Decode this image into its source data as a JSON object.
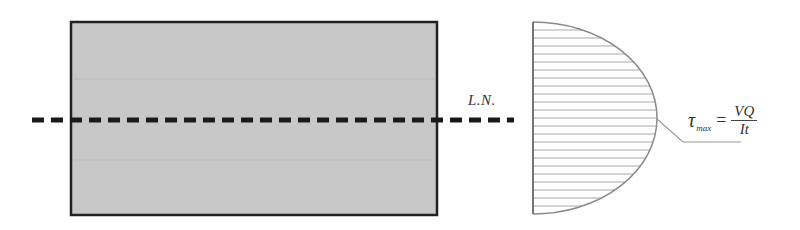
{
  "diagram": {
    "cross_section": {
      "shape": "rectangle",
      "fill_color": "#c8c8c8",
      "border_color": "#222222"
    },
    "neutral_axis": {
      "label": "L.N.",
      "style": "dashed",
      "color": "#1a1a1a"
    },
    "shear_distribution": {
      "shape": "parabolic (half-ellipse)",
      "hatch": "horizontal lines",
      "hatch_color": "#9a9a9a",
      "outline_color": "#8a8a8a"
    },
    "formula": {
      "symbol": "τ",
      "subscript": "max",
      "equals": "=",
      "numerator": "VQ",
      "denominator": "It"
    },
    "leader_line_color": "#9a9a9a"
  }
}
